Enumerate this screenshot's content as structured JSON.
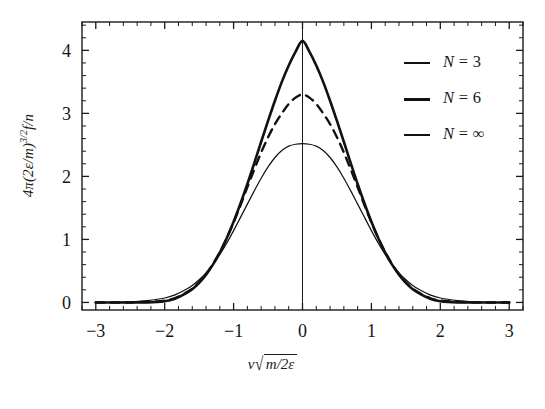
{
  "chart_data": {
    "type": "line",
    "title": "",
    "xlabel": "v√(m/2ε)",
    "ylabel": "4π(2ε/m)^(3/2) f/n",
    "xlim": [
      -3.2,
      3.2
    ],
    "ylim": [
      -0.12,
      4.45
    ],
    "xticks": [
      -3,
      -2,
      -1,
      0,
      1,
      2,
      3
    ],
    "yticks": [
      0,
      1,
      2,
      3,
      4
    ],
    "xticklabels": [
      "-3",
      "-2",
      "-1",
      "0",
      "1",
      "2",
      "3"
    ],
    "yticklabels": [
      "0",
      "1",
      "2",
      "3",
      "4"
    ],
    "minor_ticks_per_interval": 5,
    "grid": false,
    "frame": true,
    "vertical_marker_x": 0,
    "legend_position": "upper-right",
    "series": [
      {
        "name": "N = 3",
        "style": "solid",
        "linewidth": 2.6,
        "color": "#111111",
        "peak": 4.15,
        "x": [
          -3.0,
          -2.75,
          -2.5,
          -2.25,
          -2.0,
          -1.85,
          -1.7,
          -1.6,
          -1.5,
          -1.4,
          -1.3,
          -1.2,
          -1.1,
          -1.0,
          -0.9,
          -0.8,
          -0.7,
          -0.6,
          -0.5,
          -0.4,
          -0.3,
          -0.2,
          -0.1,
          0.0,
          0.1,
          0.2,
          0.3,
          0.4,
          0.5,
          0.6,
          0.7,
          0.8,
          0.9,
          1.0,
          1.1,
          1.2,
          1.3,
          1.4,
          1.5,
          1.6,
          1.7,
          1.85,
          2.0,
          2.25,
          2.5,
          2.75,
          3.0
        ],
        "y": [
          0.0,
          0.0,
          0.0,
          0.0,
          0.02,
          0.06,
          0.14,
          0.21,
          0.31,
          0.44,
          0.6,
          0.79,
          1.02,
          1.28,
          1.57,
          1.88,
          2.21,
          2.55,
          2.88,
          3.2,
          3.5,
          3.76,
          3.98,
          4.15,
          3.98,
          3.76,
          3.5,
          3.2,
          2.88,
          2.55,
          2.21,
          1.88,
          1.57,
          1.28,
          1.02,
          0.79,
          0.6,
          0.44,
          0.31,
          0.21,
          0.14,
          0.06,
          0.02,
          0.0,
          0.0,
          0.0,
          0.0
        ]
      },
      {
        "name": "N = 6",
        "style": "dashed",
        "linewidth": 2.4,
        "color": "#111111",
        "peak": 3.3,
        "x": [
          -3.0,
          -2.75,
          -2.5,
          -2.25,
          -2.0,
          -1.85,
          -1.7,
          -1.6,
          -1.5,
          -1.4,
          -1.3,
          -1.2,
          -1.1,
          -1.0,
          -0.9,
          -0.8,
          -0.7,
          -0.6,
          -0.5,
          -0.4,
          -0.3,
          -0.2,
          -0.1,
          0.0,
          0.1,
          0.2,
          0.3,
          0.4,
          0.5,
          0.6,
          0.7,
          0.8,
          0.9,
          1.0,
          1.1,
          1.2,
          1.3,
          1.4,
          1.5,
          1.6,
          1.7,
          1.85,
          2.0,
          2.25,
          2.5,
          2.75,
          3.0
        ],
        "y": [
          0.0,
          0.0,
          0.0,
          0.01,
          0.03,
          0.07,
          0.15,
          0.22,
          0.32,
          0.45,
          0.61,
          0.8,
          1.02,
          1.27,
          1.54,
          1.83,
          2.11,
          2.38,
          2.62,
          2.83,
          3.0,
          3.15,
          3.25,
          3.3,
          3.25,
          3.15,
          3.0,
          2.83,
          2.62,
          2.38,
          2.11,
          1.83,
          1.54,
          1.27,
          1.02,
          0.8,
          0.61,
          0.45,
          0.32,
          0.22,
          0.15,
          0.07,
          0.03,
          0.01,
          0.0,
          0.0,
          0.0
        ]
      },
      {
        "name": "N = ∞",
        "style": "solid",
        "linewidth": 1.2,
        "color": "#111111",
        "peak": 2.52,
        "x": [
          -3.0,
          -2.75,
          -2.5,
          -2.25,
          -2.0,
          -1.85,
          -1.7,
          -1.6,
          -1.5,
          -1.4,
          -1.3,
          -1.2,
          -1.1,
          -1.0,
          -0.9,
          -0.8,
          -0.7,
          -0.6,
          -0.5,
          -0.4,
          -0.3,
          -0.2,
          -0.1,
          0.0,
          0.1,
          0.2,
          0.3,
          0.4,
          0.5,
          0.6,
          0.7,
          0.8,
          0.9,
          1.0,
          1.1,
          1.2,
          1.3,
          1.4,
          1.5,
          1.6,
          1.7,
          1.85,
          2.0,
          2.25,
          2.5,
          2.75,
          3.0
        ],
        "y": [
          0.0,
          0.0,
          0.01,
          0.03,
          0.07,
          0.12,
          0.2,
          0.27,
          0.36,
          0.47,
          0.6,
          0.76,
          0.94,
          1.14,
          1.35,
          1.56,
          1.77,
          1.97,
          2.15,
          2.3,
          2.41,
          2.48,
          2.51,
          2.52,
          2.51,
          2.48,
          2.41,
          2.3,
          2.15,
          1.97,
          1.77,
          1.56,
          1.35,
          1.14,
          0.94,
          0.76,
          0.6,
          0.47,
          0.36,
          0.27,
          0.2,
          0.12,
          0.07,
          0.03,
          0.01,
          0.0,
          0.0
        ]
      }
    ]
  },
  "axes": {
    "x_label_parts": {
      "var": "v",
      "radicand": "m/2ε"
    },
    "y_label_parts": {
      "prefix": "4π(2ε/m)",
      "exponent": "3/2",
      "suffix": "f/n"
    }
  },
  "legend": {
    "items": [
      {
        "label": "N = 3",
        "symbol": "N",
        "value": "3",
        "style": "solid"
      },
      {
        "label": "N = 6",
        "symbol": "N",
        "value": "6",
        "style": "dashed"
      },
      {
        "label": "N = ∞",
        "symbol": "N",
        "value": "∞",
        "style": "solid"
      }
    ]
  },
  "colors": {
    "background": "#ffffff",
    "ink": "#111111",
    "axis": "#1a1a1a"
  }
}
